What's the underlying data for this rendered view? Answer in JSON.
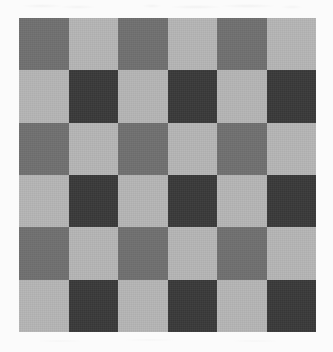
{
  "page": {
    "background_color": "#fbfbfb",
    "width": 333,
    "height": 352
  },
  "board": {
    "name": "checkerboard",
    "rows": 6,
    "columns": 6,
    "left": 19,
    "top": 18,
    "width": 297,
    "height": 314,
    "cell_width": 49.5,
    "cell_height": 52.3
  },
  "palette": {
    "light": "#b5b5b5",
    "medium": "#707070",
    "dark": "#3a3a3a",
    "background": "#fbfbfb"
  },
  "chart_data": {
    "type": "heatmap",
    "xlabel": "",
    "ylabel": "",
    "rows": 6,
    "columns": 6,
    "value_labels": [
      "light",
      "medium",
      "dark"
    ],
    "value_colors": {
      "light": "#b5b5b5",
      "medium": "#707070",
      "dark": "#3a3a3a"
    },
    "grid": [
      [
        "medium",
        "light",
        "medium",
        "light",
        "medium",
        "light"
      ],
      [
        "light",
        "dark",
        "light",
        "dark",
        "light",
        "dark"
      ],
      [
        "medium",
        "light",
        "medium",
        "light",
        "medium",
        "light"
      ],
      [
        "light",
        "dark",
        "light",
        "dark",
        "light",
        "dark"
      ],
      [
        "medium",
        "light",
        "medium",
        "light",
        "medium",
        "light"
      ],
      [
        "light",
        "dark",
        "light",
        "dark",
        "light",
        "dark"
      ]
    ]
  }
}
